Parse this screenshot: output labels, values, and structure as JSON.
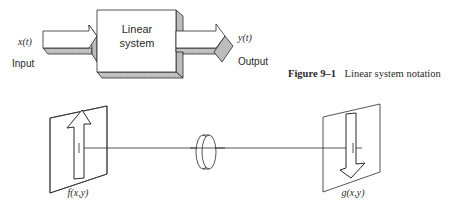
{
  "figure": {
    "caption_number": "Figure 9–1",
    "caption_text": "Linear system notation"
  },
  "block_diagram": {
    "system_label_line1": "Linear",
    "system_label_line2": "system",
    "input_signal": "x(t)",
    "input_label": "Input",
    "output_signal": "y(t)",
    "output_label": "Output"
  },
  "optical_diagram": {
    "input_plane_label": "f(x,y)",
    "output_plane_label": "g(x,y)",
    "elements": [
      "input-plane-with-upright-arrow",
      "lens",
      "output-plane-with-inverted-arrow"
    ]
  },
  "colors": {
    "stroke": "#2a2a2a",
    "shade_light": "#d9d9d9",
    "shade_mid": "#bdbdbd",
    "shade_dark": "#a8a8a8",
    "background": "#ffffff"
  }
}
